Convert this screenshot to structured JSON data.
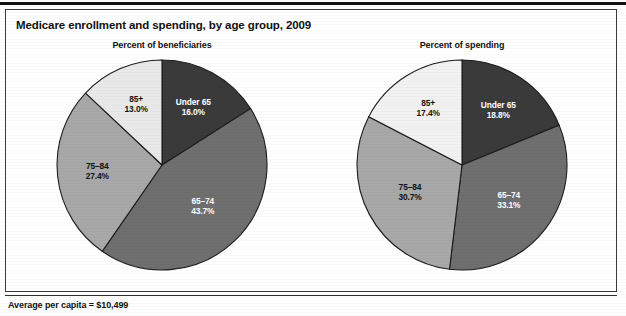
{
  "figure": {
    "title": "Medicare enrollment and spending, by age group, 2009",
    "footnote": "Average per capita = $10,499"
  },
  "chart_data": [
    {
      "type": "pie",
      "title": "Percent of beneficiaries",
      "categories": [
        "Under 65",
        "65–74",
        "75–84",
        "85+"
      ],
      "values": [
        16.0,
        43.7,
        27.4,
        13.0
      ],
      "labels": [
        "16.0%",
        "43.7%",
        "27.4%",
        "13.0%"
      ],
      "colors": [
        "#3a3a3a",
        "#6f6f6f",
        "#a8a8a8",
        "#e9e9e9"
      ],
      "label_colors": [
        "#ffffff",
        "#ffffff",
        "#111111",
        "#111111"
      ],
      "start_angle_deg": 0,
      "direction": "clockwise",
      "legend": "none",
      "grid": false
    },
    {
      "type": "pie",
      "title": "Percent of spending",
      "categories": [
        "Under 65",
        "65–74",
        "75–84",
        "85+"
      ],
      "values": [
        18.8,
        33.1,
        30.7,
        17.4
      ],
      "labels": [
        "18.8%",
        "33.1%",
        "30.7%",
        "17.4%"
      ],
      "colors": [
        "#3a3a3a",
        "#6f6f6f",
        "#a8a8a8",
        "#f2f2f2"
      ],
      "label_colors": [
        "#ffffff",
        "#ffffff",
        "#111111",
        "#111111"
      ],
      "start_angle_deg": 0,
      "direction": "clockwise",
      "legend": "none",
      "grid": false
    }
  ]
}
